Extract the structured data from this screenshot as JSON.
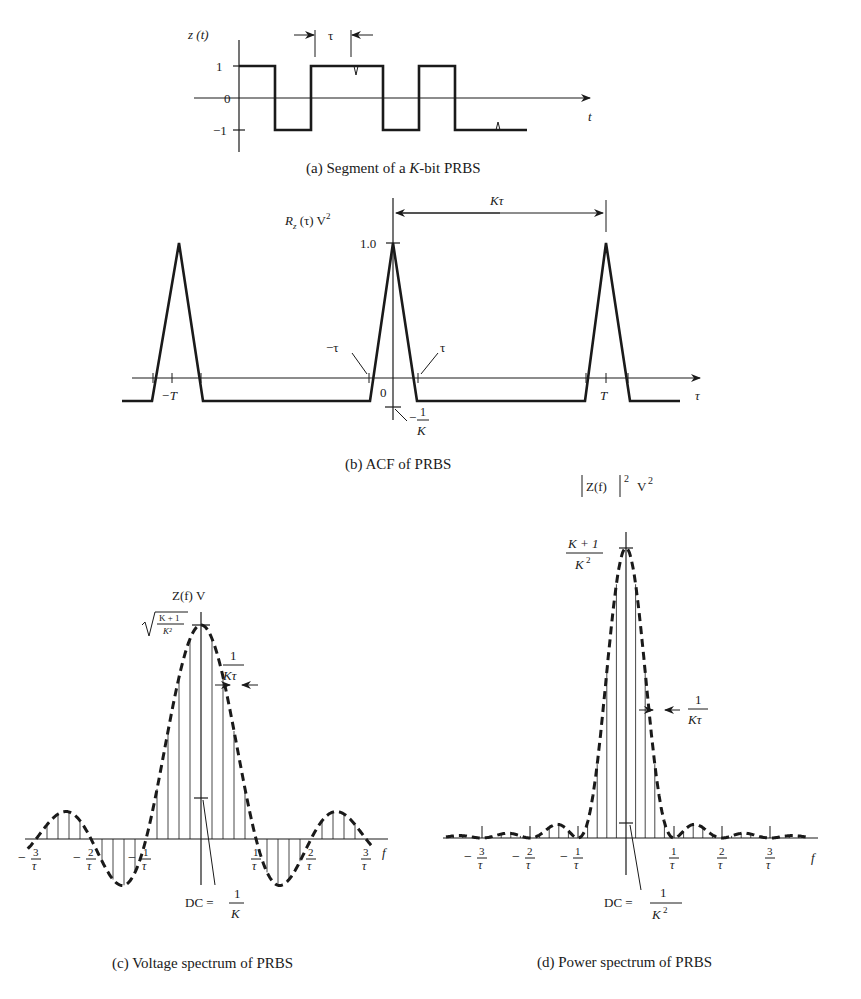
{
  "panel_a": {
    "caption_prefix": "(a) Segment of a ",
    "caption_italic": "K",
    "caption_suffix": "-bit PRBS",
    "ylabel": "z (t)",
    "xlabel": "t",
    "y_ticks": [
      "1",
      "0",
      "−1"
    ],
    "bit_width_label": "τ",
    "bits": [
      1,
      -1,
      1,
      1,
      -1,
      1,
      -1,
      -1
    ]
  },
  "panel_b": {
    "caption": "(b) ACF of PRBS",
    "ylabel_main": "R",
    "ylabel_sub": "z",
    "ylabel_rest": " (τ) V",
    "ylabel_sup": "2",
    "xlabel": "τ",
    "peak_label": "1.0",
    "period_label": "Kτ",
    "tick_labels": {
      "minus_T": "−T",
      "T": "T",
      "zero": "0",
      "minus_tau": "−τ",
      "tau": "τ",
      "floor_minus": "−",
      "floor_num": "1",
      "floor_den": "K"
    },
    "peak_value": 1.0,
    "floor_value": "-1/K"
  },
  "panel_c": {
    "caption": "(c) Voltage spectrum of PRBS",
    "ylabel": "Z(f)  V",
    "ylabel_italic": "f",
    "xlabel": "f",
    "peak_num": "K + 1",
    "peak_den": "K²",
    "spacing_num": "1",
    "spacing_den": "Kτ",
    "dc_prefix": "DC = ",
    "dc_num": "1",
    "dc_den": "K",
    "x_ticks": [
      {
        "sign": "−",
        "num": "3",
        "den": "τ"
      },
      {
        "sign": "−",
        "num": "2",
        "den": "τ"
      },
      {
        "sign": "−",
        "num": "1",
        "den": "τ"
      },
      {
        "sign": "",
        "num": "1",
        "den": "τ"
      },
      {
        "sign": "",
        "num": "2",
        "den": "τ"
      },
      {
        "sign": "",
        "num": "3",
        "den": "τ"
      }
    ]
  },
  "panel_d": {
    "caption": "(d) Power spectrum of PRBS",
    "ylabel": "Z(f)",
    "ylabel_exp": "2",
    "ylabel_unit": "V",
    "ylabel_unit_exp": "2",
    "xlabel": "f",
    "peak_num": "K + 1",
    "peak_den": "K",
    "peak_den_exp": "2",
    "spacing_num": "1",
    "spacing_den": "Kτ",
    "dc_prefix": "DC = ",
    "dc_num": "1",
    "dc_den": "K",
    "dc_den_exp": "2",
    "x_ticks": [
      {
        "sign": "−",
        "num": "3",
        "den": "τ"
      },
      {
        "sign": "−",
        "num": "2",
        "den": "τ"
      },
      {
        "sign": "−",
        "num": "1",
        "den": "τ"
      },
      {
        "sign": "",
        "num": "1",
        "den": "τ"
      },
      {
        "sign": "",
        "num": "2",
        "den": "τ"
      },
      {
        "sign": "",
        "num": "3",
        "den": "τ"
      }
    ]
  }
}
